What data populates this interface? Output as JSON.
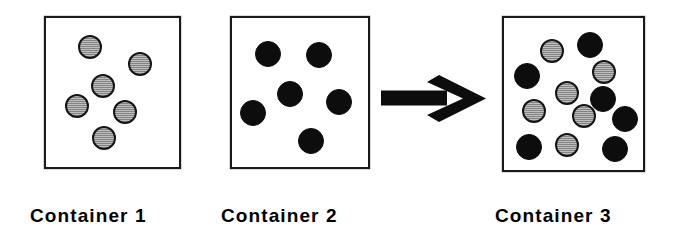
{
  "diagram": {
    "type": "particle-mixing",
    "background_color": "#ffffff",
    "arrow": {
      "name": "right-arrow",
      "label": "",
      "color": "#0d0d0d",
      "direction": "right",
      "x": 381,
      "y": 75,
      "width": 106,
      "height": 48
    },
    "colors": {
      "gray_particle_fill": "#a8a8a8",
      "gray_particle_outline": "#141414",
      "black_particle_fill": "#0d0d0d",
      "box_outline": "#1a1a1a",
      "text": "#000000"
    },
    "containers": [
      {
        "id": "container-1",
        "label": "Container 1",
        "label_x": 30,
        "label_y": 206,
        "box": {
          "x": 44,
          "y": 16,
          "width": 137,
          "height": 153
        },
        "gray_count": 6,
        "black_count": 0,
        "total_count": 6,
        "particles": [
          {
            "color": "gray",
            "cx": 90,
            "cy": 47,
            "r": 12
          },
          {
            "color": "gray",
            "cx": 140,
            "cy": 64,
            "r": 12
          },
          {
            "color": "gray",
            "cx": 103,
            "cy": 86,
            "r": 12
          },
          {
            "color": "gray",
            "cx": 77,
            "cy": 106,
            "r": 12
          },
          {
            "color": "gray",
            "cx": 125,
            "cy": 112,
            "r": 12
          },
          {
            "color": "gray",
            "cx": 104,
            "cy": 138,
            "r": 12
          }
        ]
      },
      {
        "id": "container-2",
        "label": "Container 2",
        "label_x": 221,
        "label_y": 206,
        "box": {
          "x": 230,
          "y": 16,
          "width": 140,
          "height": 153
        },
        "gray_count": 0,
        "black_count": 6,
        "total_count": 6,
        "particles": [
          {
            "color": "black",
            "cx": 268,
            "cy": 54,
            "r": 13
          },
          {
            "color": "black",
            "cx": 319,
            "cy": 55,
            "r": 13
          },
          {
            "color": "black",
            "cx": 290,
            "cy": 94,
            "r": 13
          },
          {
            "color": "black",
            "cx": 339,
            "cy": 102,
            "r": 13
          },
          {
            "color": "black",
            "cx": 253,
            "cy": 113,
            "r": 13
          },
          {
            "color": "black",
            "cx": 311,
            "cy": 141,
            "r": 13
          }
        ]
      },
      {
        "id": "container-3",
        "label": "Container 3",
        "label_x": 495,
        "label_y": 206,
        "box": {
          "x": 502,
          "y": 16,
          "width": 143,
          "height": 156
        },
        "gray_count": 6,
        "black_count": 6,
        "total_count": 12,
        "particles": [
          {
            "color": "gray",
            "cx": 552,
            "cy": 51,
            "r": 12
          },
          {
            "color": "black",
            "cx": 590,
            "cy": 45,
            "r": 13
          },
          {
            "color": "black",
            "cx": 527,
            "cy": 76,
            "r": 13
          },
          {
            "color": "gray",
            "cx": 604,
            "cy": 72,
            "r": 12
          },
          {
            "color": "gray",
            "cx": 567,
            "cy": 93,
            "r": 12
          },
          {
            "color": "black",
            "cx": 603,
            "cy": 99,
            "r": 13
          },
          {
            "color": "gray",
            "cx": 534,
            "cy": 111,
            "r": 12
          },
          {
            "color": "gray",
            "cx": 584,
            "cy": 116,
            "r": 12
          },
          {
            "color": "black",
            "cx": 625,
            "cy": 119,
            "r": 13
          },
          {
            "color": "black",
            "cx": 529,
            "cy": 147,
            "r": 13
          },
          {
            "color": "gray",
            "cx": 567,
            "cy": 145,
            "r": 12
          },
          {
            "color": "black",
            "cx": 615,
            "cy": 149,
            "r": 13
          }
        ]
      }
    ]
  }
}
